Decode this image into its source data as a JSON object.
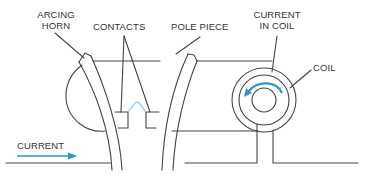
{
  "diagram": {
    "type": "magnetic blowout arc-suppression diagram",
    "labels": {
      "arcing_horn_line1": "ARCING",
      "arcing_horn_line2": "HORN",
      "contacts": "CONTACTS",
      "pole_piece": "POLE PIECE",
      "current_in_coil_line1": "CURRENT",
      "current_in_coil_line2": "IN COIL",
      "coil": "COIL",
      "current": "CURRENT"
    },
    "colors": {
      "line": "#444444",
      "text": "#333333",
      "accent_arrow": "#2a93d5",
      "arc": "#9ccfea"
    }
  }
}
